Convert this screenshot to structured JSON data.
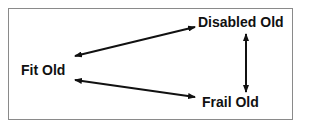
{
  "diagram": {
    "nodes": [
      {
        "id": "fit",
        "label": "Fit Old"
      },
      {
        "id": "disabled",
        "label": "Disabled Old"
      },
      {
        "id": "frail",
        "label": "Frail Old"
      }
    ],
    "edges": [
      {
        "from": "fit",
        "to": "disabled",
        "type": "bidirectional"
      },
      {
        "from": "fit",
        "to": "frail",
        "type": "bidirectional"
      },
      {
        "from": "disabled",
        "to": "frail",
        "type": "bidirectional"
      }
    ],
    "colors": {
      "border": "#8a8a8a",
      "arrow": "#111111",
      "text": "#111111"
    }
  }
}
